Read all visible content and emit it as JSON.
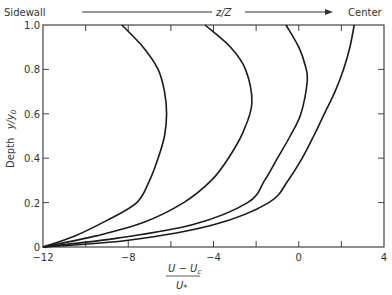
{
  "chart_data": {
    "type": "line",
    "title": "",
    "header": {
      "left": "Sidewall",
      "middle": "z/Z",
      "right": "Center"
    },
    "xlabel": {
      "numerator": "U − U",
      "numerator_sub": "c",
      "denominator": "U",
      "denominator_sub": "*"
    },
    "ylabel": {
      "text": "Depth",
      "var": "y/y",
      "var_sub": "0"
    },
    "xlim": [
      -12,
      4
    ],
    "ylim": [
      0,
      1.0
    ],
    "xticks_labeled": [
      -12,
      -8,
      -4,
      0,
      4
    ],
    "xticks_minor": [
      -10,
      -6,
      -2,
      2
    ],
    "yticks_labeled": [
      0,
      0.2,
      0.4,
      0.6,
      0.8,
      1.0
    ],
    "ytick_labels": [
      "0",
      "0.2",
      "0.4",
      "0.6",
      "0.8",
      "1.0"
    ],
    "grid": false,
    "legend": null,
    "series": [
      {
        "name": "profile-1 (near sidewall)",
        "points": [
          [
            -12,
            0
          ],
          [
            -10.5,
            0.05
          ],
          [
            -9,
            0.12
          ],
          [
            -7.6,
            0.2
          ],
          [
            -7.0,
            0.3
          ],
          [
            -6.6,
            0.4
          ],
          [
            -6.3,
            0.5
          ],
          [
            -6.2,
            0.6
          ],
          [
            -6.3,
            0.7
          ],
          [
            -6.6,
            0.8
          ],
          [
            -7.3,
            0.9
          ],
          [
            -8.3,
            1.0
          ]
        ]
      },
      {
        "name": "profile-2",
        "points": [
          [
            -12,
            0
          ],
          [
            -9.5,
            0.05
          ],
          [
            -7.3,
            0.11
          ],
          [
            -5.4,
            0.2
          ],
          [
            -4.1,
            0.3
          ],
          [
            -3.3,
            0.4
          ],
          [
            -2.6,
            0.52
          ],
          [
            -2.2,
            0.65
          ],
          [
            -2.5,
            0.8
          ],
          [
            -3.2,
            0.9
          ],
          [
            -4.4,
            1.0
          ]
        ]
      },
      {
        "name": "profile-3",
        "points": [
          [
            -12,
            0
          ],
          [
            -8.5,
            0.04
          ],
          [
            -5.0,
            0.1
          ],
          [
            -2.4,
            0.2
          ],
          [
            -1.6,
            0.3
          ],
          [
            -1.0,
            0.4
          ],
          [
            -0.4,
            0.5
          ],
          [
            0.1,
            0.6
          ],
          [
            0.4,
            0.75
          ],
          [
            0.3,
            0.82
          ],
          [
            0.0,
            0.9
          ],
          [
            -0.6,
            1.0
          ]
        ]
      },
      {
        "name": "profile-4 (near center)",
        "points": [
          [
            -12,
            0
          ],
          [
            -8.0,
            0.03
          ],
          [
            -4.0,
            0.1
          ],
          [
            -1.4,
            0.2
          ],
          [
            -0.5,
            0.3
          ],
          [
            0.16,
            0.4
          ],
          [
            0.7,
            0.5
          ],
          [
            1.2,
            0.6
          ],
          [
            1.7,
            0.7
          ],
          [
            2.1,
            0.8
          ],
          [
            2.4,
            0.9
          ],
          [
            2.6,
            1.0
          ]
        ]
      }
    ]
  },
  "layout": {
    "plot_left": 43,
    "plot_right": 384,
    "plot_top": 25,
    "plot_bottom": 247,
    "line_color": "#1a1a1a",
    "axis_color": "#444444"
  }
}
